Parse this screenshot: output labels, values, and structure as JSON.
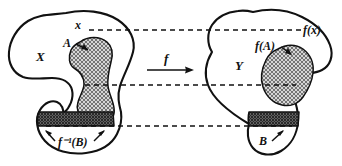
{
  "figure": {
    "domain_blob": {
      "name": "X",
      "label": "X",
      "point_label": "x",
      "subset_label": "A",
      "preimage_label": "f⁻¹(B)"
    },
    "codomain_blob": {
      "name": "Y",
      "label": "Y",
      "point_label": "f(x)",
      "image_label": "f(A)",
      "subset_label": "B"
    },
    "map": {
      "label": "f",
      "direction": "left-to-right"
    },
    "correspondence_lines": [
      {
        "name": "x-to-fx",
        "y": 30
      },
      {
        "name": "A-to-fA",
        "y": 85
      },
      {
        "name": "preimageB-to-B",
        "y": 126
      }
    ],
    "colors": {
      "ink": "#111111",
      "paper": "#ffffff",
      "light_shade": "#c9c9c9",
      "dark_shade": "#8e8e8e"
    }
  }
}
